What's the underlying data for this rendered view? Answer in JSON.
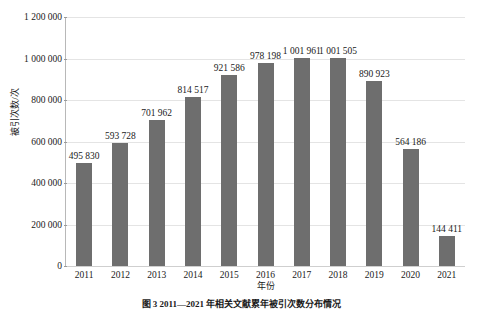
{
  "chart_data": {
    "type": "bar",
    "title": "",
    "xlabel": "年份",
    "ylabel": "被引次数/次",
    "categories": [
      "2011",
      "2012",
      "2013",
      "2014",
      "2015",
      "2016",
      "2017",
      "2018",
      "2019",
      "2020",
      "2021"
    ],
    "values": [
      495830,
      593728,
      701962,
      814517,
      921586,
      978198,
      1001961,
      1001505,
      890923,
      564186,
      144411
    ],
    "value_labels": [
      "495 830",
      "593 728",
      "701 962",
      "814 517",
      "921 586",
      "978 198",
      "1 001 961",
      "1 001 505",
      "890 923",
      "564 186",
      "144 411"
    ],
    "ylim": [
      0,
      1200000
    ],
    "ytick_values": [
      0,
      200000,
      400000,
      600000,
      800000,
      1000000,
      1200000
    ],
    "ytick_labels": [
      "0",
      "200 000",
      "400 000",
      "600 000",
      "800 000",
      "1 000 000",
      "1 200 000"
    ],
    "grid": true,
    "legend": "none",
    "bar_color": "#6e6e6e",
    "gridline_color": "#e4e4e4",
    "axis_color": "#b8b8b8",
    "background": "#ffffff"
  },
  "caption": {
    "text": "图 3 2011—2021 年相关文献累年被引次数分布情况"
  }
}
